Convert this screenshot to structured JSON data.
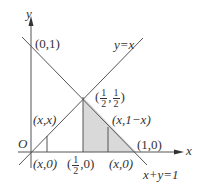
{
  "diagram": {
    "axes": {
      "x_label": "x",
      "y_label": "y",
      "origin_label": "O"
    },
    "lines": [
      {
        "name": "y=x",
        "label": "y=x"
      },
      {
        "name": "x+y=1",
        "label": "x+y=1"
      }
    ],
    "points": {
      "p01": "(0,1)",
      "p10": "(1,0)",
      "half_half": {
        "open": "(",
        "num1": "1",
        "den1": "2",
        "comma": ",",
        "num2": "1",
        "den2": "2",
        "close": ")"
      },
      "half_zero": {
        "open": "(",
        "num": "1",
        "den": "2",
        "rest": ",0)"
      },
      "xx": "(x,x)",
      "x0_left": "(x,0)",
      "x0_right": "(x,0)",
      "x_1mx": "(x,1−x)"
    },
    "colors": {
      "line": "#555555",
      "shade": "#d9d9d9",
      "text": "#333333"
    }
  }
}
